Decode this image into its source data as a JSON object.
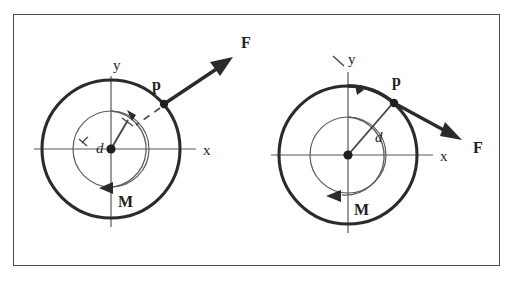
{
  "figure": {
    "border_color": "#4a4a50",
    "background": "#ffffff",
    "stroke_color": "#2b2b2f",
    "axis_color": "#58585e"
  },
  "panels": [
    {
      "id": "left",
      "name": "left-diagram",
      "center": {
        "x": 111,
        "y": 149
      },
      "outer_radius": 69,
      "inner_radius": 38,
      "axis_x_label": "x",
      "axis_y_label": "y",
      "point_label": "p",
      "force_label": "F",
      "moment_label": "M",
      "distance_label": "d",
      "point_p": {
        "x": 164,
        "y": 104
      },
      "force_tip": {
        "x": 233,
        "y": 57
      },
      "force_label_pos": {
        "x": 241,
        "y": 47
      },
      "point_label_pos": {
        "x": 155,
        "y": 90
      },
      "d_line_end": {
        "x": 128,
        "y": 122
      },
      "d_label_pos": {
        "x": 99,
        "y": 148
      },
      "moment_arrow_y": 188,
      "moment_arrow_tip_x": 99,
      "moment_label_pos": {
        "x": 121,
        "y": 206
      },
      "x_label_pos": {
        "x": 203,
        "y": 155
      },
      "y_label_pos": {
        "x": 113,
        "y": 70
      },
      "force_angle_deg": 34,
      "p_angle_deg": 40
    },
    {
      "id": "right",
      "name": "right-diagram",
      "center": {
        "x": 348,
        "y": 155
      },
      "outer_radius": 69,
      "inner_radius": 38,
      "axis_x_label": "x",
      "axis_y_label": "y",
      "point_label": "p",
      "force_label": "F",
      "moment_label": "M",
      "distance_label": "d",
      "point_p": {
        "x": 394,
        "y": 103
      },
      "force_tip": {
        "x": 462,
        "y": 140
      },
      "force_label_pos": {
        "x": 473,
        "y": 152
      },
      "point_label_pos": {
        "x": 395,
        "y": 86
      },
      "d_label_pos": {
        "x": 379,
        "y": 140
      },
      "moment_arrow_y": 196,
      "moment_arrow_tip_x": 326,
      "moment_label_pos": {
        "x": 357,
        "y": 214
      },
      "x_label_pos": {
        "x": 440,
        "y": 161
      },
      "y_label_pos": {
        "x": 350,
        "y": 63
      },
      "force_angle_deg": -29,
      "p_angle_deg": 49
    }
  ],
  "symbols": {
    "center-dot": "filled-node-point",
    "force-arrow": "vector-arrowhead",
    "moment-arrow": "rotation-arrowhead",
    "angle-arc": "angle-indicator-arc",
    "dashed-extension": "line-of-action-extension"
  }
}
